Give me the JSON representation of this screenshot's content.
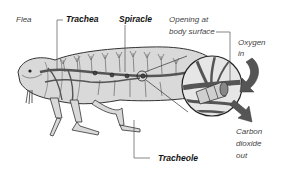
{
  "diagram": {
    "labels": {
      "flea": "Flea",
      "trachea": "Trachea",
      "spiracle": "Spiracle",
      "opening_line1": "Opening at",
      "opening_line2": "body surface",
      "oxygen_line1": "Oxygen",
      "oxygen_line2": "in",
      "carbon_line1": "Carbon",
      "carbon_line2": "dioxide",
      "carbon_line3": "out",
      "tracheole": "Tracheole"
    },
    "colors": {
      "body_fill": "#d9d9d9",
      "outline": "#333333",
      "trachea": "#555555",
      "arrow": "#555555",
      "magnifier_fill": "#e6e6e6"
    }
  }
}
